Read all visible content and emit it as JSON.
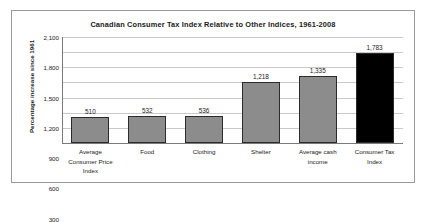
{
  "chart_data": {
    "type": "bar",
    "title": "Canadian Consumer Tax Index Relative to Other Indices, 1961-2008",
    "xlabel": "",
    "ylabel": "Percentage increase since 1961",
    "categories": [
      "Average Consumer Price Index",
      "Food",
      "Clothing",
      "Shelter",
      "Average cash income",
      "Consumer Tax Index"
    ],
    "category_lines": [
      [
        "Average",
        "Consumer Price",
        "Index"
      ],
      [
        "Food"
      ],
      [
        "Clothing"
      ],
      [
        "Shelter"
      ],
      [
        "Average cash",
        "income"
      ],
      [
        "Consumer Tax",
        "Index"
      ]
    ],
    "values": [
      510,
      532,
      536,
      1218,
      1335,
      1783
    ],
    "value_labels": [
      "510",
      "532",
      "536",
      "1,218",
      "1,335",
      "1,783"
    ],
    "bar_colors": [
      "#8c8c8c",
      "#8c8c8c",
      "#8c8c8c",
      "#8c8c8c",
      "#8c8c8c",
      "#000000"
    ],
    "ylim": [
      0,
      2100
    ],
    "yticks": [
      0,
      300,
      600,
      900,
      1200,
      1500,
      1800,
      2100
    ],
    "ytick_labels": [
      "0",
      "300",
      "600",
      "900",
      "1,200",
      "1,500",
      "1,800",
      "2,100"
    ],
    "grid": true,
    "legend": "none"
  },
  "colors": {
    "bar_gray": "#8c8c8c",
    "bar_black": "#000000",
    "gridline": "#c9c9c9",
    "axis": "#7a7a7a",
    "frame": "#9a9a9a",
    "text": "#1a1a1a",
    "background": "#ffffff"
  }
}
